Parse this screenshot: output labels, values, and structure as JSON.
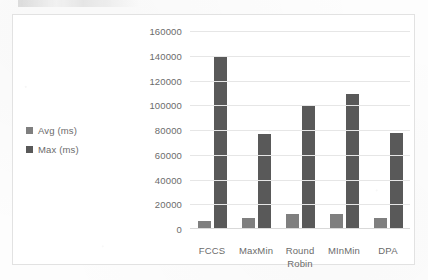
{
  "chart_data": {
    "type": "bar",
    "title": "",
    "xlabel": "",
    "ylabel": "",
    "categories": [
      "FCCS",
      "MaxMin",
      "Round Robin",
      "MInMin",
      "DPA"
    ],
    "category_lines": [
      [
        "FCCS"
      ],
      [
        "MaxMin"
      ],
      [
        "Round",
        "Robin"
      ],
      [
        "MInMin"
      ],
      [
        "DPA"
      ]
    ],
    "series": [
      {
        "name": "Avg (ms)",
        "color": "#7f7f7f",
        "values": [
          6000,
          8000,
          11000,
          11000,
          8000
        ]
      },
      {
        "name": "Max (ms)",
        "color": "#595959",
        "values": [
          139000,
          76500,
          100000,
          108500,
          77000
        ]
      }
    ],
    "ylim": [
      0,
      160000
    ],
    "ytick_step": 20000,
    "yticks": [
      160000,
      140000,
      120000,
      100000,
      80000,
      60000,
      40000,
      20000,
      0
    ],
    "ytick_labels": [
      "160000",
      "140000",
      "120000",
      "100000",
      "80000",
      "60000",
      "40000",
      "20000",
      "0"
    ],
    "grid": true,
    "grid_axis": "y",
    "legend_position": "left",
    "legend": [
      {
        "label": "Avg (ms)",
        "color": "#7f7f7f"
      },
      {
        "label": "Max (ms)",
        "color": "#595959"
      }
    ],
    "colors": {
      "avg": "#7f7f7f",
      "max": "#595959",
      "gridline": "#e6e6e6",
      "frame": "#e2e2e2",
      "text": "#6b6b6b"
    }
  }
}
